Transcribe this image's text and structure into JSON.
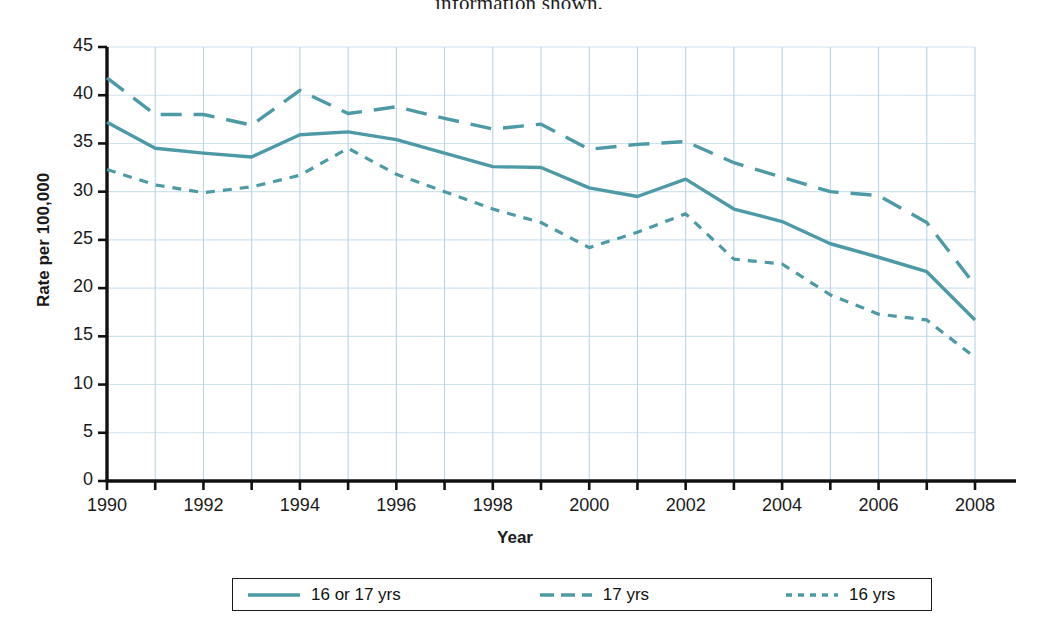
{
  "page": {
    "top_cut_text": "information shown."
  },
  "chart_data": {
    "type": "line",
    "title": "",
    "xlabel": "Year",
    "ylabel": "Rate per 100,000",
    "xlim": [
      1990,
      2008
    ],
    "ylim": [
      0,
      45
    ],
    "yticks": [
      0,
      5,
      10,
      15,
      20,
      25,
      30,
      35,
      40,
      45
    ],
    "ytick_labels": [
      "0",
      "5",
      "10",
      "15",
      "20",
      "25",
      "30",
      "35",
      "40",
      "45"
    ],
    "xticks": [
      1990,
      1992,
      1994,
      1996,
      1998,
      2000,
      2002,
      2004,
      2006,
      2008
    ],
    "xtick_labels": [
      "1990",
      "1992",
      "1994",
      "1996",
      "1998",
      "2000",
      "2002",
      "2004",
      "2006",
      "2008"
    ],
    "x": [
      1990,
      1991,
      1992,
      1993,
      1994,
      1995,
      1996,
      1997,
      1998,
      1999,
      2000,
      2001,
      2002,
      2003,
      2004,
      2005,
      2006,
      2007,
      2008
    ],
    "grid": true,
    "grid_color": "#cfe3ef",
    "legend_position": "below",
    "series": [
      {
        "name": "16 or 17 yrs",
        "style": "solid",
        "color": "#4d9aa6",
        "values": [
          37.2,
          34.5,
          34.0,
          33.6,
          35.9,
          36.2,
          35.4,
          34.0,
          32.6,
          32.5,
          30.4,
          29.5,
          31.3,
          28.2,
          26.9,
          24.6,
          23.2,
          21.7,
          16.7
        ]
      },
      {
        "name": "17 yrs",
        "style": "dashed",
        "color": "#4d9aa6",
        "values": [
          41.8,
          38.0,
          38.0,
          36.9,
          40.5,
          38.1,
          38.8,
          37.6,
          36.5,
          37.0,
          34.4,
          34.9,
          35.2,
          33.0,
          31.5,
          30.0,
          29.6,
          26.8,
          20.3
        ]
      },
      {
        "name": "16 yrs",
        "style": "dotted",
        "color": "#4d9aa6",
        "values": [
          32.3,
          30.7,
          29.9,
          30.5,
          31.7,
          34.5,
          31.8,
          30.0,
          28.2,
          26.8,
          24.2,
          25.8,
          27.7,
          23.0,
          22.5,
          19.3,
          17.3,
          16.7,
          12.8
        ]
      }
    ]
  },
  "legend": {
    "items": [
      {
        "label": "16 or 17 yrs",
        "style": "solid"
      },
      {
        "label": "17 yrs",
        "style": "dashed"
      },
      {
        "label": "16 yrs",
        "style": "dotted"
      }
    ]
  }
}
